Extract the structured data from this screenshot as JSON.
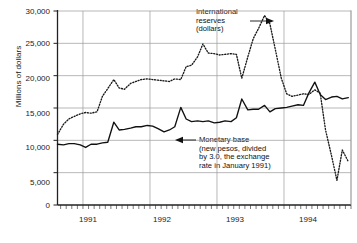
{
  "chart_data": {
    "type": "line",
    "title": "",
    "xlabel": "",
    "ylabel": "Millions of dollars",
    "ylim": [
      0,
      30000
    ],
    "ytick_labels": [
      "0",
      "5,000",
      "10,000",
      "15,000",
      "20,000",
      "25,000",
      "30,000"
    ],
    "ytick_values": [
      0,
      5000,
      10000,
      15000,
      20000,
      25000,
      30000
    ],
    "xtick_labels": [
      "1991",
      "1992",
      "1993",
      "1994"
    ],
    "xlim": [
      1990.62,
      1995.0
    ],
    "grid": "horizontal-and-year-verticals",
    "legend": "annotations-with-arrows",
    "x_minor_ticks": "monthly",
    "series": [
      {
        "name": "International reserves (dollars)",
        "style": "dotted",
        "color": "#1a1a1a",
        "x": [
          1990.62,
          1990.71,
          1990.79,
          1990.87,
          1990.96,
          1991.04,
          1991.12,
          1991.21,
          1991.29,
          1991.37,
          1991.46,
          1991.54,
          1991.62,
          1991.71,
          1991.79,
          1991.87,
          1991.96,
          1992.04,
          1992.12,
          1992.21,
          1992.29,
          1992.37,
          1992.46,
          1992.54,
          1992.62,
          1992.71,
          1992.79,
          1992.87,
          1992.96,
          1993.04,
          1993.12,
          1993.21,
          1993.29,
          1993.37,
          1993.46,
          1993.54,
          1993.62,
          1993.71,
          1993.79,
          1993.87,
          1993.96,
          1994.04,
          1994.12,
          1994.21,
          1994.29,
          1994.37,
          1994.46,
          1994.54,
          1994.62,
          1994.71,
          1994.79,
          1994.87,
          1994.96
        ],
        "values": [
          10900,
          12500,
          13300,
          13700,
          14100,
          14300,
          14200,
          14400,
          16800,
          18000,
          19400,
          18100,
          17900,
          18800,
          19100,
          19400,
          19500,
          19400,
          19300,
          19200,
          19100,
          19500,
          19400,
          21400,
          21600,
          22900,
          24900,
          23500,
          23400,
          23200,
          23300,
          23400,
          23300,
          19600,
          22900,
          25700,
          27300,
          29300,
          28000,
          24100,
          19600,
          17200,
          16800,
          17000,
          17200,
          17100,
          17800,
          17300,
          11600,
          7600,
          3800,
          8500,
          6700
        ]
      },
      {
        "name": "Monetary base (new pesos, divided by 3.0, the exchange rate in January 1991)",
        "style": "solid",
        "color": "#111111",
        "x": [
          1990.62,
          1990.71,
          1990.79,
          1990.87,
          1990.96,
          1991.04,
          1991.12,
          1991.21,
          1991.29,
          1991.37,
          1991.46,
          1991.54,
          1991.62,
          1991.71,
          1991.79,
          1991.87,
          1991.96,
          1992.04,
          1992.12,
          1992.21,
          1992.29,
          1992.37,
          1992.46,
          1992.54,
          1992.62,
          1992.71,
          1992.79,
          1992.87,
          1992.96,
          1993.04,
          1993.12,
          1993.21,
          1993.29,
          1993.37,
          1993.46,
          1993.54,
          1993.62,
          1993.71,
          1993.79,
          1993.87,
          1993.96,
          1994.04,
          1994.12,
          1994.21,
          1994.29,
          1994.37,
          1994.46,
          1994.54,
          1994.62,
          1994.71,
          1994.79,
          1994.87,
          1994.96
        ],
        "values": [
          9400,
          9300,
          9500,
          9500,
          9300,
          8900,
          9400,
          9400,
          9600,
          9700,
          12800,
          11600,
          11700,
          11900,
          12100,
          12100,
          12300,
          12200,
          11800,
          11300,
          11600,
          12100,
          15100,
          13300,
          12900,
          13000,
          12900,
          13000,
          12700,
          12800,
          13000,
          12900,
          13500,
          16400,
          14700,
          14800,
          14800,
          15400,
          14400,
          14900,
          15000,
          15100,
          15300,
          15500,
          15400,
          17300,
          19000,
          17100,
          16300,
          16700,
          16800,
          16400,
          16600
        ]
      }
    ],
    "annotations": [
      {
        "id": "international-reserves",
        "lines": [
          "International",
          "reserves",
          "(dollars)"
        ],
        "arrow": "right"
      },
      {
        "id": "monetary-base",
        "lines": [
          "Monetary base",
          "(new pesos, divided",
          "by 3.0, the exchange",
          "rate in January 1991)"
        ],
        "arrow": "left"
      }
    ]
  }
}
